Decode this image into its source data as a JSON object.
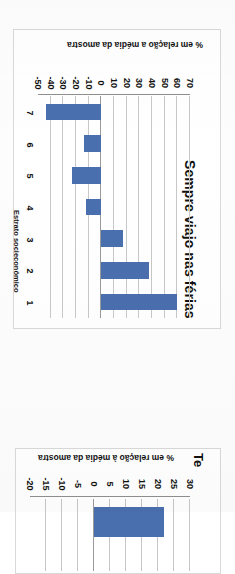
{
  "page": {
    "orientation_note": "upside-down-scan",
    "background": "#ffffff",
    "margin_fragment_text": "Gráfico 24"
  },
  "colors": {
    "bar": "#4a6fae",
    "grid": "#c7c7c7",
    "axis": "#8f8f8f",
    "text": "#111111",
    "margin_accent": "#d2761c",
    "frame": "#d9d9d9"
  },
  "chart_data": [
    {
      "id": "chart-main",
      "type": "bar",
      "title": "Sempre viajo nas férias",
      "xlabel": "Estrato socieconômico",
      "ylabel": "% em relação a média da amostra",
      "categories": [
        "1",
        "2",
        "3",
        "4",
        "5",
        "6",
        "7"
      ],
      "values": [
        60,
        38,
        17,
        -12,
        -23,
        -14,
        -44
      ],
      "ylim": [
        -50,
        70
      ],
      "yticks": [
        "70",
        "60",
        "50",
        "40",
        "30",
        "20",
        "10",
        "0",
        "-10",
        "-20",
        "-30",
        "-40",
        "-50"
      ],
      "grid": true,
      "legend": "none",
      "series": [
        {
          "name": "% em relação a média da amostra",
          "values": [
            60,
            38,
            17,
            -12,
            -23,
            -14,
            -44
          ]
        }
      ]
    },
    {
      "id": "chart-partial",
      "type": "bar",
      "title": "Te",
      "title_note": "clipped at page edge",
      "ylabel": "% em relação à média da amostra",
      "categories": [
        "1"
      ],
      "values": [
        22
      ],
      "ylim": [
        -20,
        30
      ],
      "yticks": [
        "30",
        "25",
        "20",
        "15",
        "10",
        "5",
        "0",
        "-5",
        "-10",
        "-15",
        "-20"
      ],
      "grid": true,
      "legend": "none"
    }
  ]
}
